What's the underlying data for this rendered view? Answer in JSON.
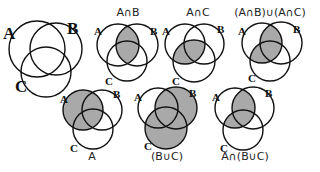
{
  "figure": {
    "fill_color": "#a9a9a9",
    "stroke_color": "#111111",
    "background": "#ffffff"
  },
  "diagrams": [
    {
      "id": "base",
      "caption": "",
      "shaded": "none",
      "circles": {
        "A": [
          37,
          49,
          28
        ],
        "B": [
          56,
          49,
          26
        ],
        "C": [
          46,
          72,
          25
        ]
      },
      "labels": {
        "A": [
          3,
          39
        ],
        "B": [
          67,
          34
        ],
        "C": [
          15,
          92
        ]
      },
      "label_size": 17,
      "caption_pos": [
        0,
        0
      ]
    },
    {
      "id": "a-intersect-b",
      "caption": "A∩B",
      "shaded": "AB",
      "circles": {
        "A": [
          118,
          45,
          21
        ],
        "B": [
          137,
          45,
          21
        ],
        "C": [
          127,
          61,
          20
        ]
      },
      "labels": {
        "A": [
          94,
          35
        ],
        "B": [
          150,
          35
        ],
        "C": [
          105,
          85
        ]
      },
      "label_size": 11,
      "caption_pos": [
        128,
        16
      ]
    },
    {
      "id": "a-intersect-c",
      "caption": "A∩C",
      "shaded": "AC",
      "circles": {
        "A": [
          185,
          44,
          20
        ],
        "B": [
          204,
          44,
          20
        ],
        "C": [
          194,
          61,
          21
        ]
      },
      "labels": {
        "A": [
          162,
          35
        ],
        "B": [
          217,
          33
        ],
        "C": [
          172,
          85
        ]
      },
      "label_size": 11,
      "caption_pos": [
        198,
        16
      ]
    },
    {
      "id": "ab-union-ac",
      "caption": "(A∩B)∪(A∩C)",
      "shaded": "AB_or_AC",
      "circles": {
        "A": [
          262,
          43,
          20
        ],
        "B": [
          281,
          43,
          21
        ],
        "C": [
          270,
          61,
          20
        ]
      },
      "labels": {
        "A": [
          238,
          35
        ],
        "B": [
          293,
          33
        ],
        "C": [
          248,
          82
        ]
      },
      "label_size": 11,
      "caption_pos": [
        270,
        16
      ]
    },
    {
      "id": "set-a",
      "caption": "A",
      "shaded": "A",
      "circles": {
        "A": [
          83,
          110,
          20
        ],
        "B": [
          102,
          110,
          20
        ],
        "C": [
          93,
          129,
          20
        ]
      },
      "labels": {
        "A": [
          60,
          103
        ],
        "B": [
          113,
          98
        ],
        "C": [
          70,
          152
        ]
      },
      "label_size": 11,
      "caption_pos": [
        92,
        160
      ]
    },
    {
      "id": "b-union-c",
      "caption": "(B∪C)",
      "shaded": "B_or_C",
      "circles": {
        "A": [
          158,
          108,
          20
        ],
        "B": [
          176,
          108,
          21
        ],
        "C": [
          166,
          128,
          21
        ]
      },
      "labels": {
        "A": [
          134,
          101
        ],
        "B": [
          189,
          97
        ],
        "C": [
          144,
          150
        ]
      },
      "label_size": 11,
      "caption_pos": [
        167,
        160
      ]
    },
    {
      "id": "a-intersect-b-union-c",
      "caption": "A∩(B∪C)",
      "shaded": "A_and_BorC",
      "circles": {
        "A": [
          235,
          108,
          20
        ],
        "B": [
          253,
          108,
          21
        ],
        "C": [
          243,
          130,
          20
        ]
      },
      "labels": {
        "A": [
          212,
          101
        ],
        "B": [
          265,
          97
        ],
        "C": [
          220,
          152
        ]
      },
      "label_size": 11,
      "caption_pos": [
        245,
        160
      ]
    }
  ]
}
